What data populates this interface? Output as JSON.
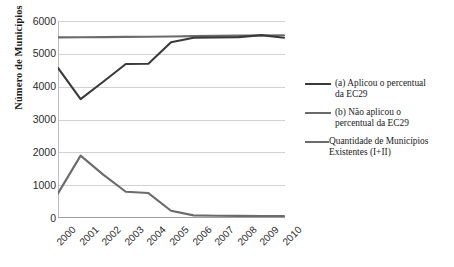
{
  "chart_data": {
    "type": "line",
    "title": "",
    "xlabel": "",
    "ylabel": "Número de Municípios",
    "x": [
      "2000",
      "2001",
      "2002",
      "2003",
      "2004",
      "2005",
      "2006",
      "2007",
      "2008",
      "2009",
      "2010"
    ],
    "ylim": [
      0,
      6000
    ],
    "yticks": [
      0,
      1000,
      2000,
      3000,
      4000,
      5000,
      6000
    ],
    "grid": "horizontal",
    "legend_position": "right",
    "series": [
      {
        "name": "(a) Aplicou o percentual da EC29",
        "color": "#3a3a3a",
        "values": [
          4570,
          3620,
          4150,
          4690,
          4700,
          5350,
          5490,
          5500,
          5510,
          5570,
          5490
        ]
      },
      {
        "name": "(b) Não aplicou o percentual da EC29",
        "color": "#6b6b6b",
        "values": [
          750,
          1900,
          1320,
          800,
          760,
          220,
          80,
          70,
          65,
          60,
          60
        ]
      },
      {
        "name": "Quantidade de Municípios Existentes (I+II)",
        "color": "#6b6b6b",
        "values": [
          5500,
          5505,
          5510,
          5515,
          5520,
          5530,
          5540,
          5550,
          5555,
          5560,
          5565
        ]
      }
    ]
  },
  "axis": {
    "y_title": "Número de Municípios",
    "y_ticks": [
      "6000",
      "5000",
      "4000",
      "3000",
      "2000",
      "1000",
      "0"
    ],
    "x_ticks": [
      "2000",
      "2001",
      "2002",
      "2003",
      "2004",
      "2005",
      "2006",
      "2007",
      "2008",
      "2009",
      "2010"
    ]
  },
  "legend": {
    "items": [
      {
        "label_line1": "(a) Aplicou o percentual",
        "label_line2": "da EC29"
      },
      {
        "label_line1": "(b) Não aplicou o",
        "label_line2": "percentual da EC29"
      },
      {
        "label_line1": "Quantidade de Municípios",
        "label_line2": "Existentes (I+II)"
      }
    ]
  },
  "colors": {
    "series_a": "#3a3a3a",
    "series_b": "#6b6b6b",
    "series_total": "#6b6b6b",
    "grid": "#d2d2d2",
    "background": "#ffffff"
  }
}
